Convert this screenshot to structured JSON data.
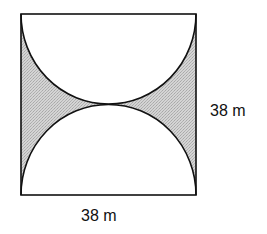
{
  "figure": {
    "shape": "square with two inscribed semicircles",
    "side_label_right": "38 m",
    "side_label_bottom": "38 m",
    "colors": {
      "stroke": "#111111",
      "shaded_region": "#c9c9c9",
      "background": "#ffffff"
    }
  }
}
